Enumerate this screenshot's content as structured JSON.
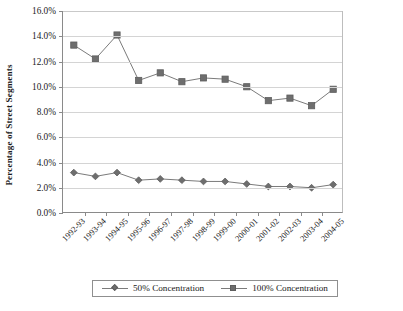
{
  "chart_data": {
    "type": "line",
    "title": "",
    "xlabel": "",
    "ylabel": "Percentage of Street Segments",
    "categories": [
      "1992-93",
      "1993-94",
      "1994-95",
      "1995-96",
      "1996-97",
      "1997-98",
      "1998-99",
      "1999-00",
      "2000-01",
      "2001-02",
      "2002-03",
      "2003-04",
      "2004-05"
    ],
    "ylim": [
      0,
      16
    ],
    "ytick_labels": [
      "0.0%",
      "2.0%",
      "4.0%",
      "6.0%",
      "8.0%",
      "10.0%",
      "12.0%",
      "14.0%",
      "16.0%"
    ],
    "ytick_values": [
      0,
      2,
      4,
      6,
      8,
      10,
      12,
      14,
      16
    ],
    "grid": true,
    "legend_position": "bottom",
    "series": [
      {
        "name": "50% Concentration",
        "marker": "diamond",
        "values": [
          3.2,
          2.9,
          3.2,
          2.6,
          2.7,
          2.6,
          2.5,
          2.5,
          2.3,
          2.1,
          2.1,
          2.0,
          2.25
        ]
      },
      {
        "name": "100% Concentration",
        "marker": "square",
        "values": [
          13.3,
          12.2,
          14.1,
          10.5,
          11.1,
          10.4,
          10.7,
          10.6,
          10.0,
          8.9,
          9.1,
          8.5,
          9.8
        ]
      }
    ]
  },
  "colors": {
    "series_line": "#7b7b7b",
    "series_marker_fill": "#6e6e6e",
    "series_marker_stroke": "#5e5e5e",
    "gridline": "#d4d4d4",
    "axis": "#8a8a8a",
    "text": "#1a1a1a",
    "plot_background": "#ffffff"
  },
  "legend": {
    "entries": [
      {
        "label": "50% Concentration",
        "marker": "diamond-marker"
      },
      {
        "label": "100% Concentration",
        "marker": "square-marker"
      }
    ]
  }
}
